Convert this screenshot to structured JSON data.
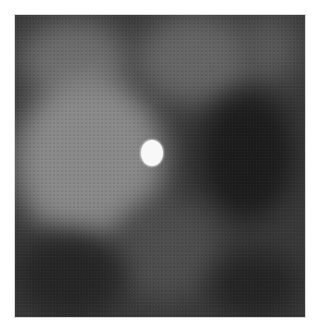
{
  "image": {
    "description": "Grayscale mammography-style tissue patch with a single bright round calcification near the center",
    "frame": {
      "x": 15,
      "y": 15,
      "width": 290,
      "height": 302
    },
    "background_color": "#ffffff",
    "base_tone": "#3a3a3a",
    "bright_spot": {
      "cx": 152,
      "cy": 153,
      "rx": 11,
      "ry": 13,
      "color": "#f8f8f8"
    },
    "regions": [
      {
        "name": "left-bright-tissue",
        "x": 0,
        "y": 60,
        "w": 150,
        "h": 170,
        "color": "#8a8a8a"
      },
      {
        "name": "upper-left-tissue",
        "x": 20,
        "y": 20,
        "w": 110,
        "h": 80,
        "color": "#6e6e6e"
      },
      {
        "name": "upper-center-tissue",
        "x": 130,
        "y": 10,
        "w": 120,
        "h": 90,
        "color": "#666666"
      },
      {
        "name": "right-dark-void",
        "x": 190,
        "y": 80,
        "w": 95,
        "h": 130,
        "color": "#1c1c1c"
      },
      {
        "name": "lower-left-dark",
        "x": 0,
        "y": 220,
        "w": 110,
        "h": 90,
        "color": "#262626"
      },
      {
        "name": "lower-right-dark",
        "x": 200,
        "y": 240,
        "w": 90,
        "h": 70,
        "color": "#242424"
      },
      {
        "name": "lower-center-mid",
        "x": 100,
        "y": 190,
        "w": 110,
        "h": 100,
        "color": "#4e4e4e"
      },
      {
        "name": "upper-right-strand",
        "x": 230,
        "y": 10,
        "w": 60,
        "h": 70,
        "color": "#595959"
      }
    ]
  }
}
